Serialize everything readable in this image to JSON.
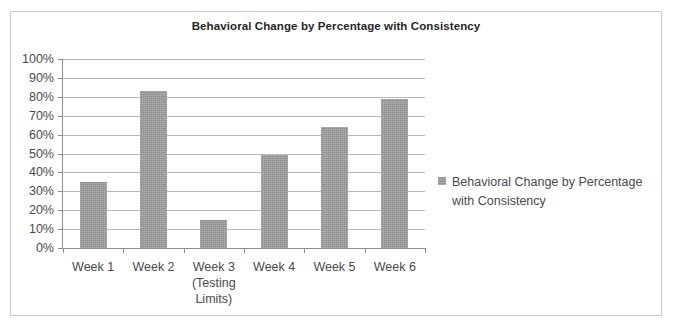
{
  "chart_data": {
    "type": "bar",
    "title": "Behavioral Change by Percentage with Consistency",
    "xlabel": "",
    "ylabel": "",
    "categories": [
      "Week 1",
      "Week 2",
      "Week 3 (Testing Limits)",
      "Week 4",
      "Week 5",
      "Week 6"
    ],
    "category_lines": [
      [
        "Week 1"
      ],
      [
        "Week 2"
      ],
      [
        "Week 3",
        "(Testing",
        "Limits)"
      ],
      [
        "Week 4"
      ],
      [
        "Week 5"
      ],
      [
        "Week 6"
      ]
    ],
    "values": [
      35,
      83,
      15,
      49,
      64,
      79
    ],
    "value_unit": "%",
    "ylim": [
      0,
      100
    ],
    "ytick_step": 10,
    "ytick_labels": [
      "100%",
      "90%",
      "80%",
      "70%",
      "60%",
      "50%",
      "40%",
      "30%",
      "20%",
      "10%",
      "0%"
    ],
    "ytick_values": [
      100,
      90,
      80,
      70,
      60,
      50,
      40,
      30,
      20,
      10,
      0
    ],
    "grid": true,
    "legend_position": "right",
    "series": [
      {
        "name": "Behavioral Change by Percentage with Consistency",
        "values": [
          35,
          83,
          15,
          49,
          64,
          79
        ],
        "color": "#9d9d9d"
      }
    ]
  },
  "legend": {
    "marker_name": "series-color-swatch",
    "line1": "Behavioral Change by",
    "line2": "Percentage with Consistency"
  },
  "colors": {
    "bar": "#9d9d9d",
    "gridline": "#b7b7b7",
    "axis": "#8d8d8d",
    "frame_border": "#c9c9c9",
    "title_text": "#262626",
    "label_text": "#4a4a4a"
  }
}
